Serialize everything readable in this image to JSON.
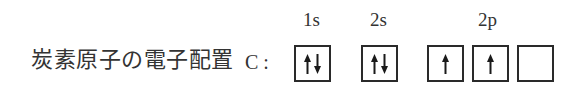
{
  "caption": {
    "text": "炭素原子の電子配置",
    "element": "C :"
  },
  "orbitals": [
    {
      "label": "1s",
      "boxes": [
        [
          "up",
          "down"
        ]
      ]
    },
    {
      "label": "2s",
      "boxes": [
        [
          "up",
          "down"
        ]
      ]
    },
    {
      "label": "2p",
      "boxes": [
        [
          "up"
        ],
        [
          "up"
        ],
        []
      ]
    }
  ],
  "colors": {
    "line": "#2a2a2a",
    "text": "#333333",
    "background": "#ffffff"
  }
}
